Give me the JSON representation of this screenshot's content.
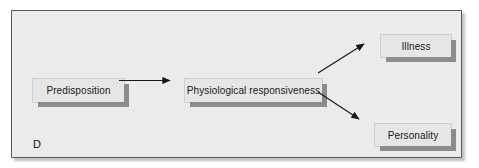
{
  "figure": {
    "label": "D",
    "panel_background": "#ebebeb",
    "border_color": "#5a5a5a",
    "box_fill": "#e6e6e6",
    "box_shadow_color": "#8c8c8c",
    "arrow_color": "#1a1a1a"
  },
  "nodes": [
    {
      "id": "predisposition",
      "label": "Predisposition"
    },
    {
      "id": "physiological",
      "label": "Physiological responsiveness"
    },
    {
      "id": "illness",
      "label": "Illness"
    },
    {
      "id": "personality",
      "label": "Personality"
    }
  ],
  "connectors": [
    {
      "id": "arrow-predisposition-to-physiological",
      "from": "predisposition",
      "to": "physiological",
      "style": "straight-horizontal"
    },
    {
      "id": "arrow-physiological-to-illness",
      "from": "physiological",
      "to": "illness",
      "style": "diagonal-up"
    },
    {
      "id": "arrow-physiological-to-personality",
      "from": "physiological",
      "to": "personality",
      "style": "diagonal-down"
    }
  ]
}
